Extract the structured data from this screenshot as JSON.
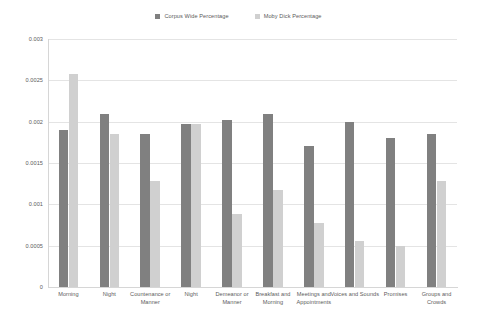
{
  "chart_data": {
    "type": "bar",
    "title": "",
    "subtitle": "",
    "xlabel": "",
    "ylabel": "",
    "ylim": [
      0,
      0.003
    ],
    "ytick_labels": [
      "0.003",
      "0.0025",
      "0.002",
      "0.0015",
      "0.001",
      "0.0005",
      "0"
    ],
    "ytick_values": [
      0.003,
      0.0025,
      0.002,
      0.0015,
      0.001,
      0.0005,
      0
    ],
    "grid": true,
    "legend_position": "top-center",
    "categories": [
      "Morning",
      "Night",
      "Countenance or Manner",
      "Night",
      "Demeanor or Manner",
      "Breakfast and Morning",
      "Meetings and Appointments",
      "Voices and Sounds",
      "Promises",
      "Groups and Crowds"
    ],
    "series": [
      {
        "name": "Corpus Wide Percentage",
        "color": "#808080",
        "values": [
          0.0019,
          0.00209,
          0.00185,
          0.00197,
          0.00202,
          0.00209,
          0.0017,
          0.002,
          0.0018,
          0.00185
        ]
      },
      {
        "name": "Moby Dick Percentage",
        "color": "#d0d0d0",
        "values": [
          0.00258,
          0.00185,
          0.00128,
          0.00197,
          0.00088,
          0.00117,
          0.00078,
          0.00056,
          0.0005,
          0.00128
        ]
      }
    ]
  },
  "legend": {
    "entries": [
      {
        "label": "Corpus Wide Percentage",
        "color": "#808080"
      },
      {
        "label": "Moby Dick Percentage",
        "color": "#d0d0d0"
      }
    ]
  }
}
